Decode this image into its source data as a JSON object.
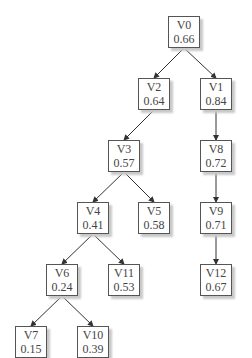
{
  "nodes": [
    {
      "id": "V0",
      "label": "V0",
      "value": "0.66",
      "x": 168,
      "y": 16
    },
    {
      "id": "V2",
      "label": "V2",
      "value": "0.64",
      "x": 138,
      "y": 78
    },
    {
      "id": "V1",
      "label": "V1",
      "value": "0.84",
      "x": 200,
      "y": 78
    },
    {
      "id": "V3",
      "label": "V3",
      "value": "0.57",
      "x": 108,
      "y": 140
    },
    {
      "id": "V4",
      "label": "V4",
      "value": "0.41",
      "x": 77,
      "y": 202
    },
    {
      "id": "V5",
      "label": "V5",
      "value": "0.58",
      "x": 138,
      "y": 202
    },
    {
      "id": "V8",
      "label": "V8",
      "value": "0.72",
      "x": 200,
      "y": 140
    },
    {
      "id": "V9",
      "label": "V9",
      "value": "0.71",
      "x": 200,
      "y": 202
    },
    {
      "id": "V6",
      "label": "V6",
      "value": "0.24",
      "x": 46,
      "y": 264
    },
    {
      "id": "V11",
      "label": "V11",
      "value": "0.53",
      "x": 108,
      "y": 264
    },
    {
      "id": "V12",
      "label": "V12",
      "value": "0.67",
      "x": 200,
      "y": 264
    },
    {
      "id": "V7",
      "label": "V7",
      "value": "0.15",
      "x": 15,
      "y": 326
    },
    {
      "id": "V10",
      "label": "V10",
      "value": "0.39",
      "x": 77,
      "y": 326
    }
  ],
  "edges": [
    [
      "V0",
      "V2"
    ],
    [
      "V0",
      "V1"
    ],
    [
      "V2",
      "V3"
    ],
    [
      "V1",
      "V8"
    ],
    [
      "V3",
      "V4"
    ],
    [
      "V3",
      "V5"
    ],
    [
      "V8",
      "V9"
    ],
    [
      "V4",
      "V6"
    ],
    [
      "V4",
      "V11"
    ],
    [
      "V9",
      "V12"
    ],
    [
      "V6",
      "V7"
    ],
    [
      "V6",
      "V10"
    ]
  ],
  "style": {
    "border": "#555555",
    "shadow": "#c8c8c8",
    "text": "#444444",
    "edge": "#333333"
  }
}
